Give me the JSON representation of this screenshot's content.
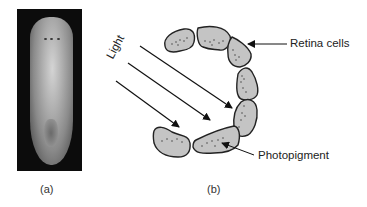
{
  "figure": {
    "panel_a": {
      "caption": "(a)",
      "image": "planarian-flatworm-photo"
    },
    "panel_b": {
      "caption": "(b)",
      "labels": {
        "light": "Light",
        "retina_cells": "Retina cells",
        "photopigment": "Photopigment"
      }
    }
  }
}
